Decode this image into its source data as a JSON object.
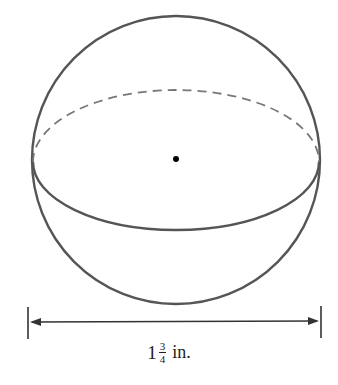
{
  "figure": {
    "type": "sphere",
    "center_point": true,
    "equator": {
      "front": "solid",
      "back": "dashed"
    },
    "colors": {
      "stroke": "#555555",
      "dashed": "#777777",
      "dot": "#000000"
    }
  },
  "dimension": {
    "whole": "1",
    "numerator": "3",
    "denominator": "4",
    "unit": "in."
  }
}
